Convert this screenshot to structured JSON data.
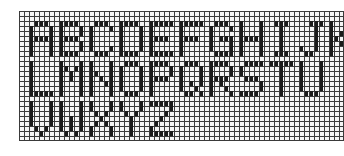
{
  "rows": [
    {
      "label": "ABCDEFGHIJK",
      "letters": [
        "A",
        "B",
        "C",
        "D",
        "E",
        "F",
        "G",
        "H",
        "I",
        "J",
        "K"
      ]
    },
    {
      "label": "LMNOPQRSTU",
      "letters": [
        "L",
        "M",
        "N",
        "O",
        "P",
        "Q",
        "R",
        "S",
        "T",
        "U"
      ]
    },
    {
      "label": "VWXYZ",
      "letters": [
        "V",
        "W",
        "X",
        "Y",
        "Z"
      ]
    }
  ],
  "grid": {
    "cell_px": 5,
    "cols": 65,
    "rows": 26,
    "line_color": "#3a3a3a",
    "ink_color": "#1a1a1a",
    "background": "#f4f4f4"
  }
}
